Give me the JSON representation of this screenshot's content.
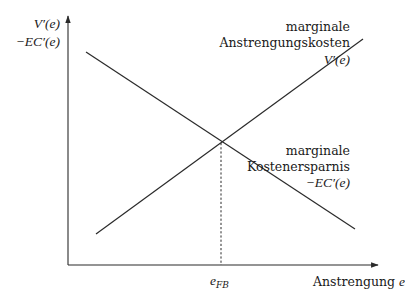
{
  "diagram": {
    "title": "",
    "y_axis": {
      "label_line1": "V′(e)",
      "label_line2": "−EC′(e)"
    },
    "x_axis": {
      "label": "Anstrengung",
      "label_var": "e"
    },
    "curves": [
      {
        "id": "marginal-effort-cost",
        "label_line1": "marginale",
        "label_line2": "Anstrengungskosten",
        "label_math": "V′(e)",
        "slope": "increasing"
      },
      {
        "id": "marginal-cost-saving",
        "label_line1": "marginale",
        "label_line2": "Kostenersparnis",
        "label_math": "−EC′(e)",
        "slope": "decreasing"
      }
    ],
    "intersection": {
      "label_base": "e",
      "label_sub": "FB",
      "guide": "dashed vertical line to x-axis"
    },
    "colors": {
      "line": "#2a2a2a",
      "text": "#1a1a1a",
      "background": "#ffffff"
    }
  }
}
